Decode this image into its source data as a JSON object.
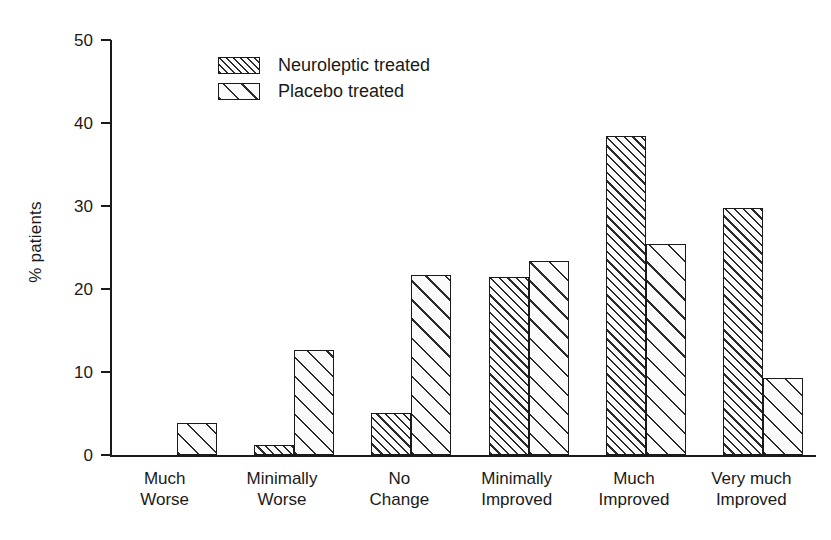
{
  "chart_data": {
    "type": "bar",
    "title": "",
    "xlabel": "",
    "ylabel": "% patients",
    "ylim": [
      0,
      50
    ],
    "yticks": [
      0,
      10,
      20,
      30,
      40,
      50
    ],
    "ytick_labels": [
      "0",
      "10",
      "20",
      "30",
      "40",
      "50"
    ],
    "grid": false,
    "legend_position": "top-left-inside",
    "categories": [
      "Much\nWorse",
      "Minimally\nWorse",
      "No\nChange",
      "Minimally\nImproved",
      "Much\nImproved",
      "Very much\nImproved"
    ],
    "series": [
      {
        "name": "Neuroleptic treated",
        "hatch": "dense-diagonal",
        "values": [
          0,
          1.2,
          5.1,
          21.5,
          38.4,
          29.8
        ]
      },
      {
        "name": "Placebo treated",
        "hatch": "sparse-diagonal",
        "values": [
          3.8,
          12.6,
          21.7,
          23.4,
          25.4,
          9.3
        ]
      }
    ]
  },
  "legend": {
    "entries": [
      {
        "label": "Neuroleptic treated"
      },
      {
        "label": "Placebo treated"
      }
    ]
  },
  "colors": {
    "axis": "#1a1a1a",
    "hatch": "#2b2b2b",
    "bar_fill": "#fbfbfb",
    "background": "#ffffff"
  }
}
